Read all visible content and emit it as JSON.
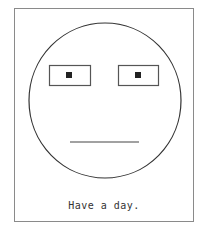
{
  "card": {
    "caption": "Have a day."
  },
  "face": {
    "expression": "neutral",
    "stroke_color": "#333333",
    "pupil_color": "#222222",
    "eye_border_color": "#555555"
  }
}
